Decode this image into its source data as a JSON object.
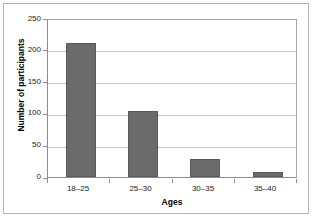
{
  "chart_data": {
    "type": "bar",
    "title": "",
    "subtitle": "",
    "xlabel": "Ages",
    "ylabel": "Number of participants",
    "categories": [
      "18–25",
      "25–30",
      "30–35",
      "35–40"
    ],
    "values": [
      214,
      105,
      29,
      8
    ],
    "series": [
      {
        "name": "Number of participants",
        "values": [
          214,
          105,
          29,
          8
        ]
      }
    ],
    "ylim": [
      0,
      250
    ],
    "yticks": [
      0,
      50,
      100,
      150,
      200,
      250
    ],
    "ytick_labels": [
      "0",
      "50",
      "100",
      "150",
      "200",
      "250"
    ],
    "grid": "horizontal",
    "legend": "none",
    "bar_color": "#6b6b6b",
    "bar_edge_color": "#5a5a5a",
    "gridline_color": "#c8c8c8",
    "axis_color": "#8c8c8c",
    "plot_background": "#ffffff",
    "figure_border_color": "#b4b4b4"
  }
}
